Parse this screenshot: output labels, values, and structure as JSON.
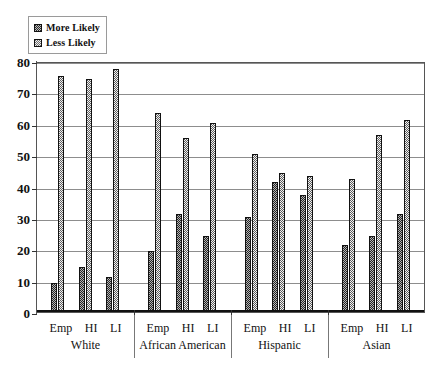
{
  "legend": {
    "position": "top-left",
    "items": [
      {
        "label": "More Likely",
        "swatch": "more-likely-swatch"
      },
      {
        "label": "Less Likely",
        "swatch": "less-likely-swatch"
      }
    ]
  },
  "chart_data": {
    "type": "bar",
    "title": "",
    "xlabel": "",
    "ylabel": "",
    "ylim": [
      0,
      80
    ],
    "yticks": [
      0,
      10,
      20,
      30,
      40,
      50,
      60,
      70,
      80
    ],
    "grid": true,
    "legend_position": "top-left",
    "groups": [
      "White",
      "African American",
      "Hispanic",
      "Asian"
    ],
    "subcategories": [
      "Emp",
      "HI",
      "LI"
    ],
    "categories": [
      "White Emp",
      "White HI",
      "White LI",
      "African American Emp",
      "African American HI",
      "African American LI",
      "Hispanic Emp",
      "Hispanic HI",
      "Hispanic LI",
      "Asian Emp",
      "Asian HI",
      "Asian LI"
    ],
    "series": [
      {
        "name": "More Likely",
        "values": [
          9,
          14,
          11,
          19,
          31,
          24,
          30,
          41,
          37,
          21,
          24,
          31
        ]
      },
      {
        "name": "Less Likely",
        "values": [
          75,
          74,
          77,
          63,
          55,
          60,
          50,
          44,
          43,
          42,
          56,
          61
        ]
      }
    ]
  }
}
